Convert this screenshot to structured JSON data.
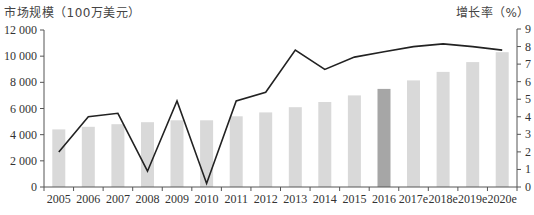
{
  "chart_data": {
    "type": "bar+line",
    "title": "",
    "ylabel_left": "市场规模（100万美元）",
    "ylabel_right": "增长率（%）",
    "categories": [
      "2005",
      "2006",
      "2007",
      "2008",
      "2009",
      "2010",
      "2011",
      "2012",
      "2013",
      "2014",
      "2015",
      "2016",
      "2017e",
      "2018e",
      "2019e",
      "2020e"
    ],
    "series": [
      {
        "name": "市场规模",
        "type": "bar",
        "axis": "left",
        "values": [
          4400,
          4600,
          4800,
          4950,
          5100,
          5100,
          5400,
          5700,
          6100,
          6500,
          7000,
          7500,
          8150,
          8800,
          9550,
          10300
        ],
        "color": "#d9d9d9",
        "highlight_index": 11,
        "highlight_color": "#a6a6a6"
      },
      {
        "name": "增长率",
        "type": "line",
        "axis": "right",
        "values": [
          2.0,
          4.0,
          4.2,
          0.9,
          4.9,
          0.2,
          4.9,
          5.4,
          7.8,
          6.7,
          7.4,
          7.7,
          8.0,
          8.15,
          8.0,
          7.8
        ],
        "color": "#222222"
      }
    ],
    "ylim_left": [
      0,
      12000
    ],
    "yticks_left": [
      "0",
      "2 000",
      "4 000",
      "6 000",
      "8 000",
      "10 000",
      "12 000"
    ],
    "ylim_right": [
      0,
      9
    ],
    "yticks_right": [
      "0",
      "1",
      "2",
      "3",
      "4",
      "5",
      "6",
      "7",
      "8",
      "9"
    ],
    "grid": false,
    "legend": "none"
  },
  "labels": {
    "left_axis_title": "市场规模（100万美元）",
    "right_axis_title": "增长率（%）"
  }
}
